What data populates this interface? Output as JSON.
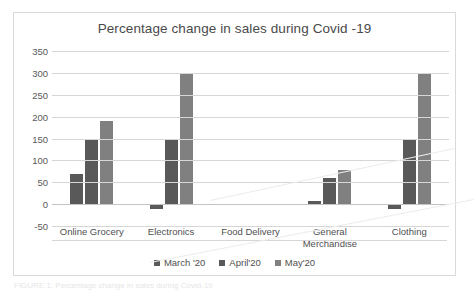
{
  "chart_data": {
    "type": "bar",
    "title": "Percentage change in sales during Covid -19",
    "xlabel": "",
    "ylabel": "",
    "ylim": [
      -50,
      350
    ],
    "ytick_step": 50,
    "yticks": [
      "350",
      "300",
      "250",
      "200",
      "150",
      "100",
      "50",
      "0",
      "-50"
    ],
    "grid": true,
    "legend_position": "bottom",
    "categories": [
      "Online Grocery",
      "Electronics",
      "Food Delivery",
      "General Merchandise",
      "Clothing"
    ],
    "series": [
      {
        "name": "March '20",
        "color": "#595959",
        "values": [
          70,
          -10,
          0,
          8,
          -10
        ]
      },
      {
        "name": "April'20",
        "color": "#595959",
        "values": [
          150,
          150,
          0,
          60,
          148
        ]
      },
      {
        "name": "May'20",
        "color": "#808080",
        "values": [
          190,
          300,
          0,
          78,
          300
        ]
      }
    ]
  },
  "caption": {
    "text": "FIGURE 1: Percentage change in sales during Covid-19"
  }
}
